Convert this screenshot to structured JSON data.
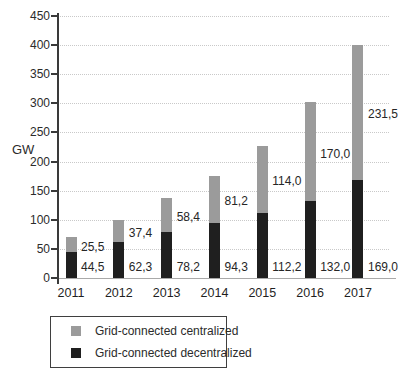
{
  "chart_data": {
    "type": "bar",
    "stacked": true,
    "title": "",
    "xlabel": "",
    "ylabel": "GW",
    "ylim": [
      0,
      450
    ],
    "yticks": [
      0,
      50,
      100,
      150,
      200,
      250,
      300,
      350,
      400,
      450
    ],
    "grid": true,
    "decimal_separator": ",",
    "categories": [
      "2011",
      "2012",
      "2013",
      "2014",
      "2015",
      "2016",
      "2017"
    ],
    "series": [
      {
        "name": "Grid-connected decentralized",
        "color": "#1f1f1f",
        "values": [
          44.5,
          62.3,
          78.2,
          94.3,
          112.2,
          132.0,
          169.0
        ],
        "labels": [
          "44,5",
          "62,3",
          "78,2",
          "94,3",
          "112,2",
          "132,0",
          "169,0"
        ]
      },
      {
        "name": "Grid-connected centralized",
        "color": "#9b9b9b",
        "values": [
          25.5,
          37.4,
          58.4,
          81.2,
          114.0,
          170.0,
          231.5
        ],
        "labels": [
          "25,5",
          "37,4",
          "58,4",
          "81,2",
          "114,0",
          "170,0",
          "231,5"
        ]
      }
    ],
    "legend": {
      "position": "bottom-left",
      "entries": [
        {
          "label": "Grid-connected centralized",
          "color": "#9b9b9b"
        },
        {
          "label": "Grid-connected decentralized",
          "color": "#1f1f1f"
        }
      ]
    },
    "colors": {
      "gridline": "#c9c9c9",
      "axis": "#3a3a3a",
      "baseline": "#a9a9a9",
      "text": "#2b2b2b"
    }
  }
}
